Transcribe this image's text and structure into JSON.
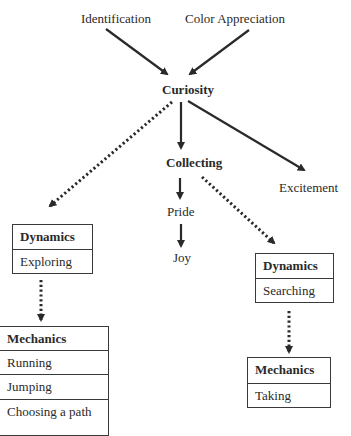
{
  "diagram": {
    "nodes": {
      "identification": "Identification",
      "color_appreciation": "Color Appreciation",
      "curiosity": "Curiosity",
      "collecting": "Collecting",
      "excitement": "Excitement",
      "pride": "Pride",
      "joy": "Joy"
    },
    "boxes": {
      "dynamics_left": {
        "header": "Dynamics",
        "items": [
          "Exploring"
        ]
      },
      "dynamics_right": {
        "header": "Dynamics",
        "items": [
          "Searching"
        ]
      },
      "mechanics_left": {
        "header": "Mechanics",
        "items": [
          "Running",
          "Jumping",
          "Choosing a path"
        ]
      },
      "mechanics_right": {
        "header": "Mechanics",
        "items": [
          "Taking"
        ]
      }
    },
    "edges": [
      {
        "from": "Identification",
        "to": "Curiosity",
        "style": "solid"
      },
      {
        "from": "Color Appreciation",
        "to": "Curiosity",
        "style": "solid"
      },
      {
        "from": "Curiosity",
        "to": "Collecting",
        "style": "solid"
      },
      {
        "from": "Curiosity",
        "to": "Excitement",
        "style": "solid"
      },
      {
        "from": "Curiosity",
        "to": "Dynamics (Exploring)",
        "style": "dotted"
      },
      {
        "from": "Collecting",
        "to": "Pride",
        "style": "solid"
      },
      {
        "from": "Pride",
        "to": "Joy",
        "style": "solid"
      },
      {
        "from": "Collecting",
        "to": "Dynamics (Searching)",
        "style": "dotted"
      },
      {
        "from": "Dynamics (Exploring)",
        "to": "Mechanics (Running/Jumping/Choosing a path)",
        "style": "dotted"
      },
      {
        "from": "Dynamics (Searching)",
        "to": "Mechanics (Taking)",
        "style": "dotted"
      }
    ],
    "colors": {
      "line": "#2a2a2a",
      "background": "#ffffff"
    }
  }
}
